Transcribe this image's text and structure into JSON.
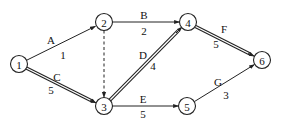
{
  "diagram": {
    "type": "activity-on-arrow network",
    "nodes": [
      {
        "id": "1",
        "label": "1",
        "x": 19,
        "y": 64
      },
      {
        "id": "2",
        "label": "2",
        "x": 104,
        "y": 22
      },
      {
        "id": "3",
        "label": "3",
        "x": 104,
        "y": 106
      },
      {
        "id": "4",
        "label": "4",
        "x": 188,
        "y": 22
      },
      {
        "id": "5",
        "label": "5",
        "x": 187,
        "y": 106
      },
      {
        "id": "6",
        "label": "6",
        "x": 262,
        "y": 60
      }
    ],
    "edges": [
      {
        "from": "1",
        "to": "2",
        "activity": "A",
        "duration": "1",
        "style": "single"
      },
      {
        "from": "1",
        "to": "3",
        "activity": "C",
        "duration": "5",
        "style": "double"
      },
      {
        "from": "2",
        "to": "4",
        "activity": "B",
        "duration": "2",
        "style": "single"
      },
      {
        "from": "2",
        "to": "3",
        "activity": "",
        "duration": "",
        "style": "dashed"
      },
      {
        "from": "3",
        "to": "4",
        "activity": "D",
        "duration": "4",
        "style": "double"
      },
      {
        "from": "3",
        "to": "5",
        "activity": "E",
        "duration": "5",
        "style": "single"
      },
      {
        "from": "4",
        "to": "6",
        "activity": "F",
        "duration": "5",
        "style": "double"
      },
      {
        "from": "5",
        "to": "6",
        "activity": "G",
        "duration": "3",
        "style": "single"
      }
    ],
    "labels": {
      "A": "A",
      "A_dur": "1",
      "B": "B",
      "B_dur": "2",
      "C": "C",
      "C_dur": "5",
      "D": "D",
      "D_dur": "4",
      "E": "E",
      "E_dur": "5",
      "F": "F",
      "F_dur": "5",
      "G": "G",
      "G_dur": "3"
    },
    "node_labels": {
      "n1": "1",
      "n2": "2",
      "n3": "3",
      "n4": "4",
      "n5": "5",
      "n6": "6"
    },
    "colors": {
      "line": "#222222",
      "background": "#ffffff"
    }
  }
}
